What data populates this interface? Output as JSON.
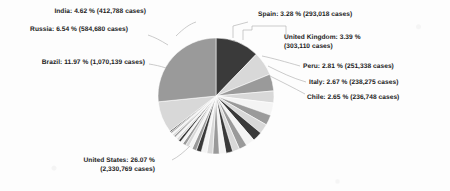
{
  "chart_data": {
    "type": "pie",
    "title": "",
    "subtitle": "",
    "xlabel": "",
    "ylabel": "",
    "legend_position": "none",
    "grid": false,
    "units": "cases",
    "value_label_format": "{name}: {percent} % ({cases} cases)",
    "start_angle_deg": 0,
    "direction": "clockwise",
    "categories": [
      "Brazil",
      "Russia",
      "India",
      "Spain",
      "United Kingdom",
      "Peru",
      "Italy",
      "Chile",
      "Iran",
      "Mexico",
      "Pakistan",
      "Turkey",
      "Germany",
      "Saudi Arabia",
      "South Africa",
      "France",
      "Bangladesh",
      "Canada",
      "Qatar",
      "China",
      "Colombia",
      "Egypt",
      "Argentina",
      "Belgium",
      "Sweden",
      "Iraq",
      "Indonesia",
      "Belarus",
      "Netherlands",
      "Ecuador",
      "Other"
    ],
    "values": [
      11.97,
      6.54,
      4.62,
      3.28,
      3.39,
      2.81,
      2.67,
      2.65,
      2.42,
      2.18,
      1.92,
      1.86,
      1.82,
      1.76,
      1.62,
      1.54,
      1.38,
      1.22,
      1.05,
      0.94,
      0.88,
      0.76,
      0.68,
      0.62,
      0.58,
      0.54,
      0.49,
      0.44,
      0.4,
      0.36,
      8.55
    ],
    "labeled_slices": [
      {
        "name": "India",
        "percent": "4.62",
        "cases": "412,788",
        "label": "India: 4.62 % (412,788 cases)"
      },
      {
        "name": "Russia",
        "percent": "6.54",
        "cases": "584,680",
        "label": "Russia: 6.54 % (584,680 cases)"
      },
      {
        "name": "Brazil",
        "percent": "11.97",
        "cases": "1,070,139",
        "label": "Brazil: 11.97 % (1,070,139 cases)"
      },
      {
        "name": "United States",
        "percent": "26.07",
        "cases": "2,330,769",
        "label_line1": "United States: 26.07 %",
        "label_line2": "(2,330,769 cases)"
      },
      {
        "name": "Spain",
        "percent": "3.28",
        "cases": "293,018",
        "label": "Spain: 3.28 % (293,018 cases)"
      },
      {
        "name": "United Kingdom",
        "percent": "3.39",
        "cases": "303,110",
        "label_line1": "United Kingdom: 3.39 %",
        "label_line2": "(303,110 cases)"
      },
      {
        "name": "Peru",
        "percent": "2.81",
        "cases": "251,338",
        "label": "Peru: 2.81 % (251,338 cases)"
      },
      {
        "name": "Italy",
        "percent": "2.67",
        "cases": "238,275",
        "label": "Italy: 2.67 % (238,275 cases)"
      },
      {
        "name": "Chile",
        "percent": "2.65",
        "cases": "236,748",
        "label": "Chile: 2.65 % (236,748 cases)"
      }
    ],
    "colors": {
      "background": "#fdfdfd",
      "text": "#1c1c1c",
      "leader_line": "#b4b4b4",
      "slice_dark": "#3a3a3a",
      "slice_mid": "#9a9a9a",
      "slice_light": "#d8d8d8",
      "slice_white": "#f4f4f4"
    }
  },
  "labels": {
    "india": "India: 4.62 % (412,788 cases)",
    "russia": "Russia: 6.54 % (584,680 cases)",
    "brazil": "Brazil: 11.97 % (1,070,139 cases)",
    "us_line1": "United States: 26.07 %",
    "us_line2": "(2,330,769 cases)",
    "spain": "Spain: 3.28 % (293,018 cases)",
    "uk_line1": "United Kingdom: 3.39 %",
    "uk_line2": "(303,110 cases)",
    "peru": "Peru: 2.81 % (251,338 cases)",
    "italy": "Italy: 2.67 % (238,275 cases)",
    "chile": "Chile: 2.65 % (236,748 cases)"
  }
}
